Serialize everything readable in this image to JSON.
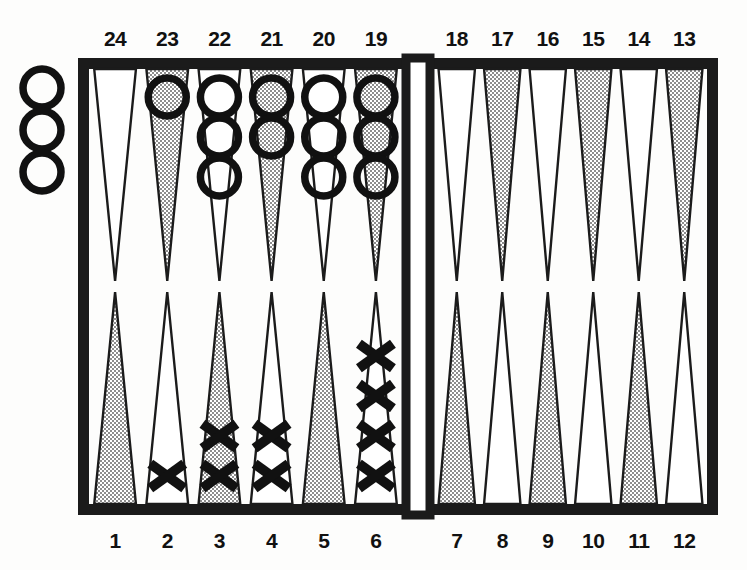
{
  "diagram": {
    "title": "Backgammon Board Position",
    "board": {
      "frame_color": "#1b1b1b",
      "point_shaded_color": "#b9b9b9",
      "point_white_color": "#ffffff",
      "point_outline_color": "#1b1b1b",
      "background_color": "#fdfdfc",
      "frame_left": 78,
      "frame_top": 58,
      "frame_right": 718,
      "frame_bottom": 515,
      "frame_thickness": 11,
      "bar_left": 406,
      "bar_right": 430
    },
    "checker_styles": {
      "O": {
        "name": "open-ring-checker",
        "glyph": "O",
        "color": "#111111"
      },
      "X": {
        "name": "cross-checker",
        "glyph": "X",
        "color": "#111111"
      }
    },
    "top_labels": [
      "24",
      "23",
      "22",
      "21",
      "20",
      "19",
      "18",
      "17",
      "16",
      "15",
      "14",
      "13"
    ],
    "bottom_labels": [
      "1",
      "2",
      "3",
      "4",
      "5",
      "6",
      "7",
      "8",
      "9",
      "10",
      "11",
      "12"
    ],
    "off_board_checkers": {
      "side": "left",
      "type": "O",
      "count": 3
    },
    "points": [
      {
        "label": "24",
        "row": "top",
        "quadrant": "top-left",
        "index": 0,
        "shaded": false,
        "checker_type": null,
        "count": 0
      },
      {
        "label": "23",
        "row": "top",
        "quadrant": "top-left",
        "index": 1,
        "shaded": true,
        "checker_type": "O",
        "count": 1
      },
      {
        "label": "22",
        "row": "top",
        "quadrant": "top-left",
        "index": 2,
        "shaded": false,
        "checker_type": "O",
        "count": 3
      },
      {
        "label": "21",
        "row": "top",
        "quadrant": "top-left",
        "index": 3,
        "shaded": true,
        "checker_type": "O",
        "count": 2
      },
      {
        "label": "20",
        "row": "top",
        "quadrant": "top-left",
        "index": 4,
        "shaded": false,
        "checker_type": "O",
        "count": 3
      },
      {
        "label": "19",
        "row": "top",
        "quadrant": "top-left",
        "index": 5,
        "shaded": true,
        "checker_type": "O",
        "count": 3
      },
      {
        "label": "18",
        "row": "top",
        "quadrant": "top-right",
        "index": 6,
        "shaded": false,
        "checker_type": null,
        "count": 0
      },
      {
        "label": "17",
        "row": "top",
        "quadrant": "top-right",
        "index": 7,
        "shaded": true,
        "checker_type": null,
        "count": 0
      },
      {
        "label": "16",
        "row": "top",
        "quadrant": "top-right",
        "index": 8,
        "shaded": false,
        "checker_type": null,
        "count": 0
      },
      {
        "label": "15",
        "row": "top",
        "quadrant": "top-right",
        "index": 9,
        "shaded": true,
        "checker_type": null,
        "count": 0
      },
      {
        "label": "14",
        "row": "top",
        "quadrant": "top-right",
        "index": 10,
        "shaded": false,
        "checker_type": null,
        "count": 0
      },
      {
        "label": "13",
        "row": "top",
        "quadrant": "top-right",
        "index": 11,
        "shaded": true,
        "checker_type": null,
        "count": 0
      },
      {
        "label": "1",
        "row": "bottom",
        "quadrant": "bottom-left",
        "index": 0,
        "shaded": true,
        "checker_type": null,
        "count": 0
      },
      {
        "label": "2",
        "row": "bottom",
        "quadrant": "bottom-left",
        "index": 1,
        "shaded": false,
        "checker_type": "X",
        "count": 1
      },
      {
        "label": "3",
        "row": "bottom",
        "quadrant": "bottom-left",
        "index": 2,
        "shaded": true,
        "checker_type": "X",
        "count": 2
      },
      {
        "label": "4",
        "row": "bottom",
        "quadrant": "bottom-left",
        "index": 3,
        "shaded": false,
        "checker_type": "X",
        "count": 2
      },
      {
        "label": "5",
        "row": "bottom",
        "quadrant": "bottom-left",
        "index": 4,
        "shaded": true,
        "checker_type": null,
        "count": 0
      },
      {
        "label": "6",
        "row": "bottom",
        "quadrant": "bottom-left",
        "index": 5,
        "shaded": false,
        "checker_type": "X",
        "count": 4
      },
      {
        "label": "7",
        "row": "bottom",
        "quadrant": "bottom-right",
        "index": 6,
        "shaded": true,
        "checker_type": null,
        "count": 0
      },
      {
        "label": "8",
        "row": "bottom",
        "quadrant": "bottom-right",
        "index": 7,
        "shaded": false,
        "checker_type": null,
        "count": 0
      },
      {
        "label": "9",
        "row": "bottom",
        "quadrant": "bottom-right",
        "index": 8,
        "shaded": true,
        "checker_type": null,
        "count": 0
      },
      {
        "label": "10",
        "row": "bottom",
        "quadrant": "bottom-right",
        "index": 9,
        "shaded": false,
        "checker_type": null,
        "count": 0
      },
      {
        "label": "11",
        "row": "bottom",
        "quadrant": "bottom-right",
        "index": 10,
        "shaded": true,
        "checker_type": null,
        "count": 0
      },
      {
        "label": "12",
        "row": "bottom",
        "quadrant": "bottom-right",
        "index": 11,
        "shaded": false,
        "checker_type": null,
        "count": 0
      }
    ]
  }
}
